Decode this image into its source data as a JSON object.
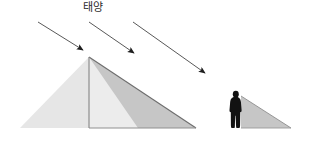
{
  "canvas": {
    "width": 311,
    "height": 144,
    "background": "#ffffff"
  },
  "labels": {
    "sun": "태양"
  },
  "colors": {
    "background": "#ffffff",
    "pyramid_lit": "#e9e9e9",
    "pyramid_lit_left": "#e6e6e6",
    "pyramid_face_right": "#ececec",
    "shadow_large": "#c6c6c6",
    "shadow_small": "#c6c6c6",
    "outline": "#808080",
    "outline_dark": "#6e6e6e",
    "person": "#121212",
    "arrow": "#3a3a3a",
    "text": "#2b2b2b"
  },
  "diagram": {
    "title_text": "태양",
    "pyramid": {
      "name": "large-pyramid",
      "apex": {
        "x": 89,
        "y": 57
      },
      "base_left": {
        "x": 20,
        "y": 128
      },
      "base_right": {
        "x": 196,
        "y": 128
      },
      "vertical_edge_bottom": {
        "x": 89,
        "y": 128
      }
    },
    "pyramid_shadow": {
      "name": "large-pyramid-shadow",
      "points": [
        {
          "x": 89,
          "y": 57
        },
        {
          "x": 196,
          "y": 128
        },
        {
          "x": 138,
          "y": 128
        }
      ]
    },
    "person": {
      "name": "person-silhouette",
      "x": 229,
      "y": 90,
      "width": 14,
      "height": 38,
      "head_cx": 236,
      "head_cy": 94
    },
    "person_shadow": {
      "name": "person-shadow",
      "points": [
        {
          "x": 241,
          "y": 96
        },
        {
          "x": 291,
          "y": 128
        },
        {
          "x": 241,
          "y": 128
        }
      ]
    },
    "sun_rays": [
      {
        "name": "sun-ray-1",
        "x1": 38,
        "y1": 22,
        "x2": 83,
        "y2": 50
      },
      {
        "name": "sun-ray-2",
        "x1": 89,
        "y1": 22,
        "x2": 134,
        "y2": 53
      },
      {
        "name": "sun-ray-3",
        "x1": 133,
        "y1": 22,
        "x2": 205,
        "y2": 73
      }
    ]
  }
}
